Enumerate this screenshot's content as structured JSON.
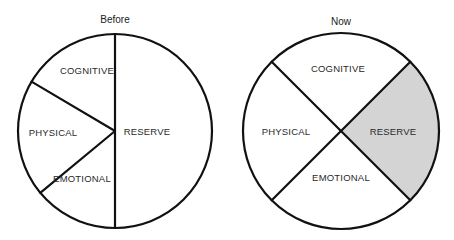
{
  "chart_data": [
    {
      "type": "pie",
      "title": "Before",
      "start_angle_deg": 90,
      "direction": "counterclockwise",
      "slices": [
        {
          "label": "COGNITIVE",
          "share_pct": 16.5,
          "shaded": false
        },
        {
          "label": "PHYSICAL",
          "share_pct": 19.5,
          "shaded": false
        },
        {
          "label": "EMOTIONAL",
          "share_pct": 14.0,
          "shaded": false
        },
        {
          "label": "RESERVE",
          "share_pct": 50.0,
          "shaded": false
        }
      ]
    },
    {
      "type": "pie",
      "title": "Now",
      "start_angle_deg": 45,
      "direction": "counterclockwise",
      "slices": [
        {
          "label": "COGNITIVE",
          "share_pct": 25,
          "shaded": false
        },
        {
          "label": "PHYSICAL",
          "share_pct": 25,
          "shaded": false
        },
        {
          "label": "EMOTIONAL",
          "share_pct": 25,
          "shaded": false
        },
        {
          "label": "RESERVE",
          "share_pct": 25,
          "shaded": true
        }
      ]
    }
  ],
  "colors": {
    "stroke": "#111111",
    "fill": "#ffffff",
    "shaded_fill": "#d4d4d4"
  }
}
